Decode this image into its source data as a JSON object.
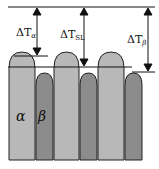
{
  "diagram": {
    "labels": {
      "dt_alpha": {
        "base": "ΔT",
        "sub": "α"
      },
      "dt_sl": {
        "base": "ΔT",
        "sub": "SL"
      },
      "dt_beta": {
        "base": "ΔT",
        "sub": "β"
      },
      "phase_alpha": "α",
      "phase_beta": "β"
    },
    "colors": {
      "alpha": "#b5b5b5",
      "beta": "#8a8a8a",
      "outline": "#222222",
      "line": "#111111"
    }
  }
}
